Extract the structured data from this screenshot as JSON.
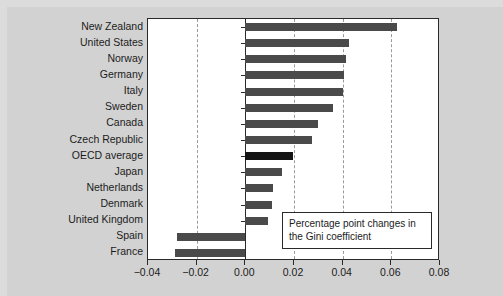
{
  "chart_data": {
    "type": "bar",
    "orientation": "horizontal",
    "title": "",
    "subtitle": "",
    "xlabel": "",
    "ylabel": "",
    "xlim": [
      -0.04,
      0.08
    ],
    "xticks": [
      -0.04,
      -0.02,
      0.0,
      0.02,
      0.04,
      0.06,
      0.08
    ],
    "xtick_labels": [
      "−0.04",
      "−0.02",
      "0.00",
      "0.02",
      "0.04",
      "0.06",
      "0.08"
    ],
    "grid": "vertical-dashed",
    "legend_position": "inside-bottom-right",
    "annotation": {
      "line1": "Percentage point changes in",
      "line2": "the Gini coefficient"
    },
    "categories": [
      "New Zealand",
      "United States",
      "Norway",
      "Germany",
      "Italy",
      "Sweden",
      "Canada",
      "Czech Republic",
      "OECD average",
      "Japan",
      "Netherlands",
      "Denmark",
      "United Kingdom",
      "Spain",
      "France"
    ],
    "values": [
      0.0625,
      0.0425,
      0.0415,
      0.0405,
      0.04,
      0.036,
      0.03,
      0.0275,
      0.0195,
      0.015,
      0.0115,
      0.011,
      0.0095,
      -0.028,
      -0.029
    ],
    "highlight_category": "OECD average",
    "colors": {
      "bar": "#4a4a4a",
      "bar_highlight": "#141414",
      "plot_background": "#ffffff",
      "figure_background": "#d2d2d2",
      "axis": "#2a2a2a",
      "gridline": "#9a9a9a",
      "text": "#1c1c1c"
    }
  }
}
